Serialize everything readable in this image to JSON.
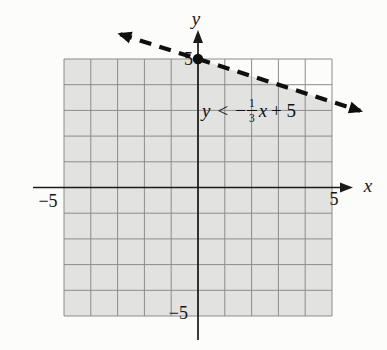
{
  "figure": {
    "background": "#fcfcfb",
    "shade_color": "#e2e2e0",
    "grid_color": "#8c8c8c",
    "axis_color": "#1b1b1b",
    "line_color": "#0f0f0f"
  },
  "chart_data": {
    "type": "line",
    "subtype": "linear-inequality-graph",
    "title": "",
    "xlabel": "x",
    "ylabel": "y",
    "xlim": [
      -5,
      5
    ],
    "ylim": [
      -5,
      5
    ],
    "grid": true,
    "x_ticks": [
      {
        "value": -5,
        "label": "−5"
      },
      {
        "value": 5,
        "label": "5"
      }
    ],
    "y_ticks": [
      {
        "value": 5,
        "label": "5"
      },
      {
        "value": -5,
        "label": "−5"
      }
    ],
    "boundary_line": {
      "equation": "y = −(1/3)x + 5",
      "slope": -0.3333333,
      "intercept": 5,
      "style": "dashed",
      "arrows": "both",
      "draw_range_x": [
        -2.9,
        6.05
      ]
    },
    "points": [
      {
        "x": 0,
        "y": 5,
        "marker": "filled-circle"
      }
    ],
    "shaded_region": "below-line",
    "annotation": {
      "text": "y < −(1/3)x + 5",
      "parts": {
        "var_y": "y",
        "relation": "<",
        "minus": "−",
        "numerator": "1",
        "denominator": "3",
        "var_x": "x",
        "tail": "+ 5"
      }
    }
  }
}
